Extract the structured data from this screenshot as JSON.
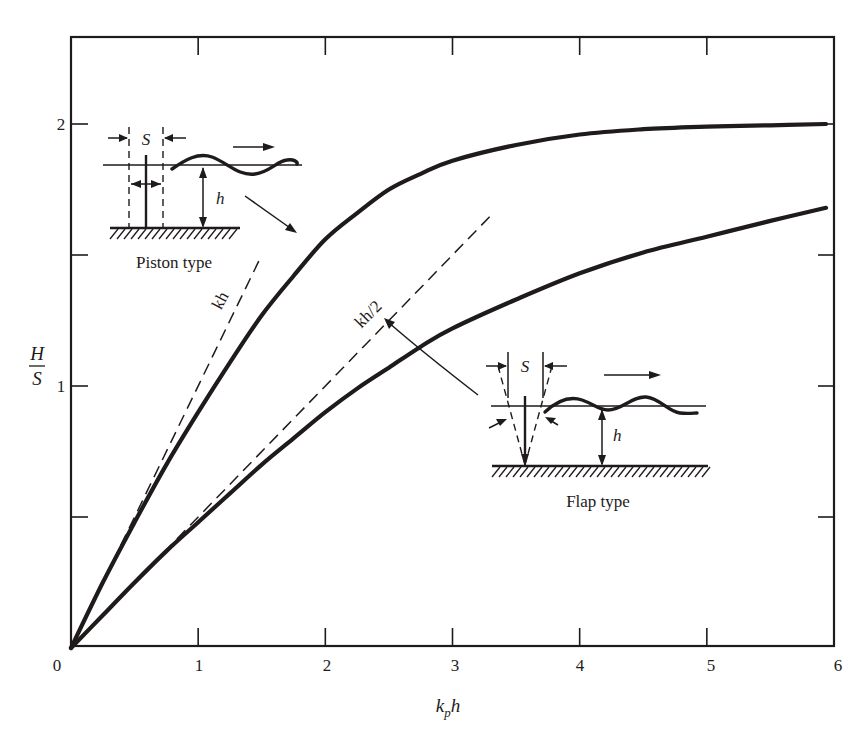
{
  "chart_data": {
    "type": "line",
    "title": "",
    "xlabel": "k_p h",
    "ylabel": "H/S",
    "xlim": [
      0,
      6
    ],
    "ylim": [
      0,
      2.3
    ],
    "grid": false,
    "legend": "none (curves labeled via inset diagrams)",
    "x_ticks": [
      0,
      1,
      2,
      3,
      4,
      5,
      6
    ],
    "y_ticks": [
      0.5,
      1,
      1.5,
      2
    ],
    "y_tick_labels_shown": [
      "1",
      "2"
    ],
    "x": [
      0,
      0.25,
      0.5,
      0.75,
      1.0,
      1.25,
      1.5,
      1.75,
      2.0,
      2.25,
      2.5,
      2.75,
      3.0,
      3.5,
      4.0,
      4.5,
      5.0,
      5.5,
      6.0
    ],
    "series": [
      {
        "name": "Piston type",
        "style": "solid thick",
        "values": [
          0,
          0.25,
          0.48,
          0.7,
          0.9,
          1.09,
          1.27,
          1.42,
          1.56,
          1.66,
          1.75,
          1.81,
          1.86,
          1.92,
          1.96,
          1.98,
          1.99,
          1.995,
          2.0
        ]
      },
      {
        "name": "Flap type",
        "style": "solid thick",
        "values": [
          0,
          0.125,
          0.25,
          0.37,
          0.48,
          0.59,
          0.7,
          0.8,
          0.9,
          0.99,
          1.07,
          1.15,
          1.22,
          1.33,
          1.43,
          1.51,
          1.57,
          1.63,
          1.68
        ]
      },
      {
        "name": "kh",
        "style": "dashed asymptote",
        "x": [
          0,
          1.5
        ],
        "values": [
          0,
          1.5
        ]
      },
      {
        "name": "kh/2",
        "style": "dashed asymptote",
        "x": [
          0,
          3.3
        ],
        "values": [
          0,
          1.65
        ]
      }
    ],
    "annotations": [
      {
        "text": "kh",
        "near": "dashed line along piston curve, x≈1.2"
      },
      {
        "text": "kh/2",
        "near": "dashed line along flap curve, x≈2.5"
      },
      {
        "text": "Piston type",
        "inset": "upper-left schematic, arrow to piston curve"
      },
      {
        "text": "Flap type",
        "inset": "lower-right schematic, arrow to flap curve"
      },
      {
        "text": "S",
        "meaning": "paddle stroke (both insets)"
      },
      {
        "text": "h",
        "meaning": "water depth (both insets)"
      }
    ]
  },
  "axes": {
    "x_label_main": "k",
    "x_label_sub": "p",
    "x_label_tail": "h",
    "y_label_num": "H",
    "y_label_den": "S",
    "x_tick_labels": [
      "0",
      "1",
      "2",
      "3",
      "4",
      "5",
      "6"
    ],
    "y_tick_labels": {
      "one": "1",
      "two": "2"
    }
  },
  "insets": {
    "piston": {
      "title": "Piston type",
      "stroke_label": "S",
      "depth_label": "h"
    },
    "flap": {
      "title": "Flap type",
      "stroke_label": "S",
      "depth_label": "h"
    }
  },
  "asymptote_labels": {
    "piston": "kh",
    "flap": "kh/2"
  },
  "colors": {
    "ink": "#1e1b1a",
    "paper": "#ffffff"
  }
}
